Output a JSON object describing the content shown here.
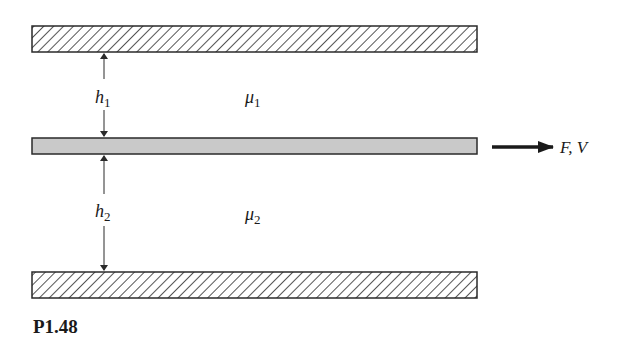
{
  "figure": {
    "caption": "P1.48",
    "colors": {
      "stroke": "#2a2a2a",
      "moving_plate_fill": "#c9c9c9",
      "background": "#ffffff"
    }
  },
  "plates": {
    "top": {
      "name": "fixed upper wall",
      "pattern": "hatched"
    },
    "middle": {
      "name": "moving plate",
      "pattern": "gray fill"
    },
    "bottom": {
      "name": "fixed lower wall",
      "pattern": "hatched"
    }
  },
  "gaps": {
    "upper": {
      "height_symbol": "h",
      "height_subscript": "1",
      "viscosity_symbol": "μ",
      "viscosity_subscript": "1"
    },
    "lower": {
      "height_symbol": "h",
      "height_subscript": "2",
      "viscosity_symbol": "μ",
      "viscosity_subscript": "2"
    }
  },
  "force": {
    "label": "F, V",
    "direction": "right"
  }
}
